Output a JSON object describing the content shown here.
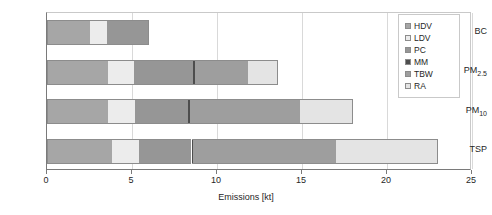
{
  "chart_data": {
    "type": "bar",
    "orientation": "horizontal",
    "stacked": true,
    "title": "",
    "xlabel": "Emissions [kt]",
    "ylabel": "",
    "xlim": [
      0,
      25
    ],
    "xticks": [
      0,
      5,
      10,
      15,
      20,
      25
    ],
    "xticklabels": [
      "0",
      "5",
      "10",
      "15",
      "20",
      "25"
    ],
    "grid": true,
    "grid_axis": "x",
    "legend_position": "upper right",
    "categories": [
      "BC",
      "PM2.5",
      "PM10",
      "TSP"
    ],
    "category_labels_html": [
      "BC",
      "PM<sub>2.5</sub>",
      "PM<sub>10</sub>",
      "TSP"
    ],
    "series": [
      {
        "name": "HDV",
        "color": "#a6a6a6",
        "values": [
          2.5,
          3.6,
          3.6,
          3.8
        ]
      },
      {
        "name": "LDV",
        "color": "#ececec",
        "values": [
          1.0,
          1.5,
          1.6,
          1.6
        ]
      },
      {
        "name": "PC",
        "color": "#969696",
        "values": [
          2.5,
          3.5,
          3.1,
          3.1
        ]
      },
      {
        "name": "MM",
        "color": "#4d4d4d",
        "values": [
          0.0,
          0.1,
          0.1,
          0.1
        ]
      },
      {
        "name": "TBW",
        "color": "#9e9e9e",
        "values": [
          0.0,
          3.1,
          6.5,
          8.4
        ]
      },
      {
        "name": "RA",
        "color": "#e4e4e4",
        "values": [
          0.0,
          1.8,
          3.1,
          6.0
        ]
      }
    ],
    "totals": [
      6.0,
      13.6,
      18.0,
      23.0
    ]
  },
  "legend": {
    "entries": [
      {
        "label": "HDV"
      },
      {
        "label": "LDV"
      },
      {
        "label": "PC"
      },
      {
        "label": "MM"
      },
      {
        "label": "TBW"
      },
      {
        "label": "RA"
      }
    ]
  },
  "axis": {
    "x_title": "Emissions [kt]"
  }
}
